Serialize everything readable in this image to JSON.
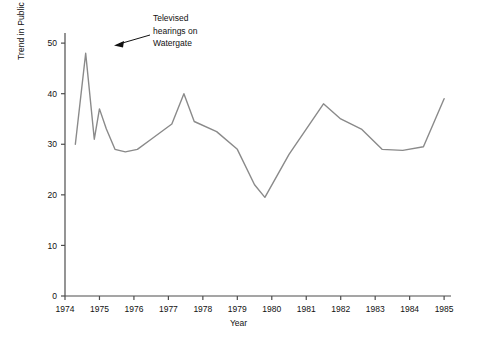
{
  "chart_data": {
    "type": "line",
    "title": "",
    "xlabel": "Year",
    "ylabel": "Trend in Public Approval of Congress (in percent)",
    "xlim": [
      1974.0,
      1985.2
    ],
    "ylim": [
      0,
      52
    ],
    "yticks": [
      0,
      10,
      20,
      30,
      40,
      50
    ],
    "xticks": [
      1974,
      1975,
      1976,
      1977,
      1978,
      1979,
      1980,
      1981,
      1982,
      1983,
      1984,
      1985
    ],
    "grid": false,
    "legend": null,
    "series": [
      {
        "name": "Public approval of Congress",
        "x": [
          1974.3,
          1974.6,
          1974.85,
          1975.0,
          1975.2,
          1975.45,
          1975.75,
          1976.1,
          1976.5,
          1977.1,
          1977.45,
          1977.75,
          1978.4,
          1979.0,
          1979.5,
          1979.8,
          1980.5,
          1981.5,
          1982.0,
          1982.6,
          1983.2,
          1983.8,
          1984.4,
          1985.0
        ],
        "values": [
          30,
          48,
          31,
          37,
          33,
          29,
          28.5,
          29,
          31,
          34,
          40,
          34.5,
          32.5,
          29,
          22,
          19.5,
          28,
          38,
          35,
          33,
          29,
          28.8,
          29.5,
          39
        ]
      }
    ],
    "annotations": [
      {
        "text": "Televised\nhearings on\nWatergate",
        "target_x": 1974.6,
        "target_y": 48
      }
    ]
  },
  "annotation_lines": [
    "Televised",
    "hearings on",
    "Watergate"
  ],
  "axis": {
    "x_title": "Year",
    "y_title": "Trend in Public Approval of Congress (in percent)"
  },
  "colors": {
    "line": "#8a8a8a",
    "axis": "#4d4d4d",
    "text": "#111111",
    "background": "#ffffff"
  }
}
